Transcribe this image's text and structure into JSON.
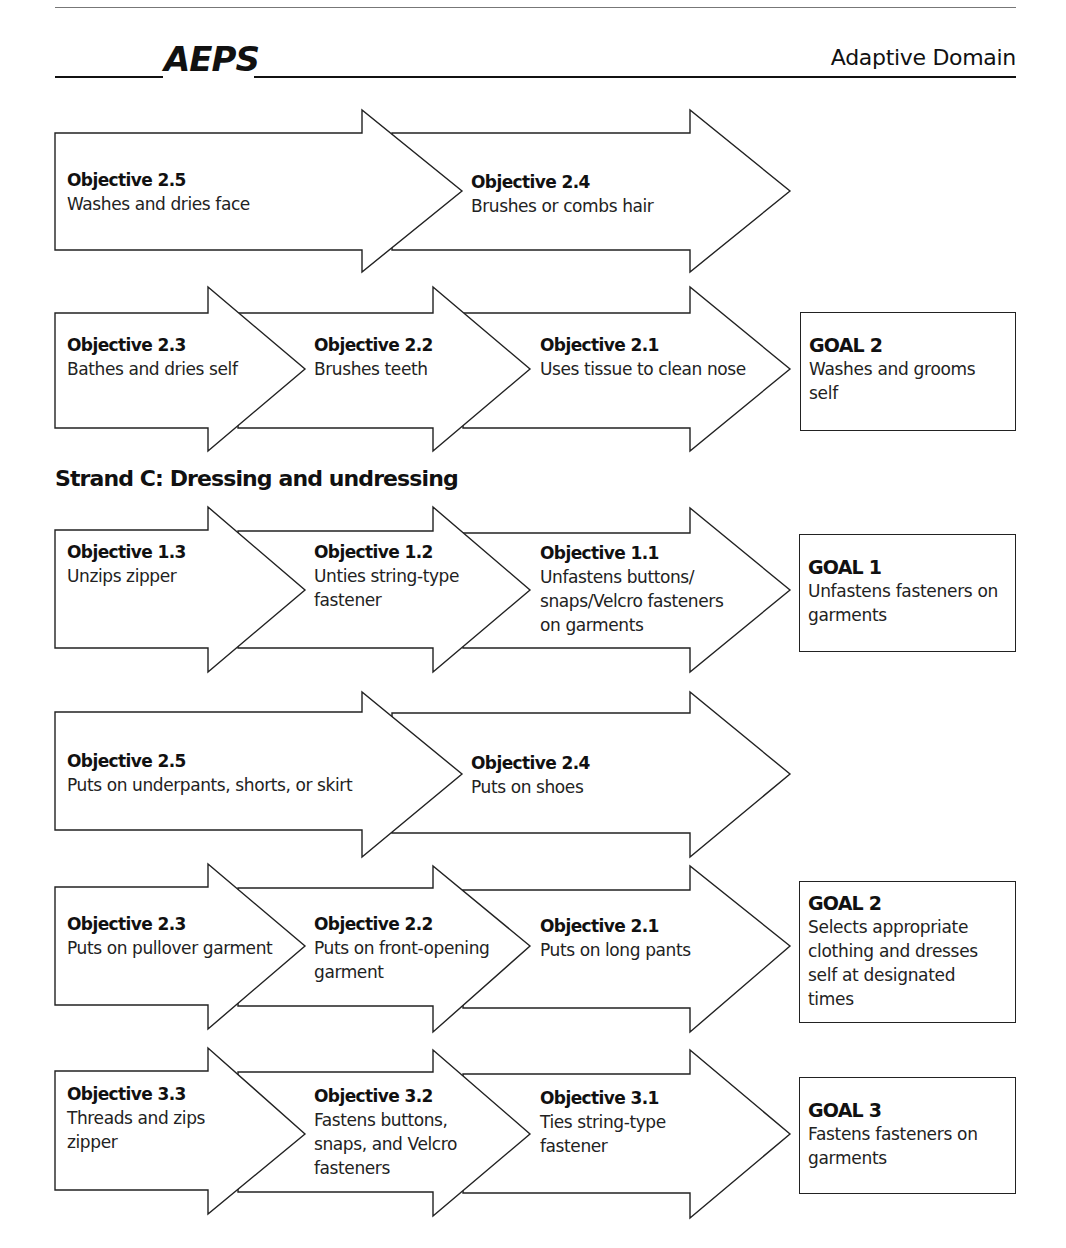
{
  "header": {
    "logo": "AEPS",
    "domain": "Adaptive Domain"
  },
  "rows": [
    {
      "objectives": [
        {
          "title": "Objective 2.5",
          "desc": "Washes and dries face"
        },
        {
          "title": "Objective 2.4",
          "desc": "Brushes or combs hair"
        }
      ]
    },
    {
      "objectives": [
        {
          "title": "Objective 2.3",
          "desc": "Bathes and dries self"
        },
        {
          "title": "Objective 2.2",
          "desc": "Brushes teeth"
        },
        {
          "title": "Objective 2.1",
          "desc": "Uses tissue to clean nose"
        }
      ],
      "goal": {
        "title": "GOAL 2",
        "desc": "Washes and grooms\nself"
      }
    }
  ],
  "strand": {
    "title": "Strand C: Dressing and undressing"
  },
  "strand_rows": [
    {
      "objectives": [
        {
          "title": "Objective 1.3",
          "desc": "Unzips zipper"
        },
        {
          "title": "Objective 1.2",
          "desc": "Unties string-type\nfastener"
        },
        {
          "title": "Objective 1.1",
          "desc": "Unfastens buttons/\nsnaps/Velcro fasteners\non garments"
        }
      ],
      "goal": {
        "title": "GOAL 1",
        "desc": "Unfastens fasteners on\ngarments"
      }
    },
    {
      "objectives": [
        {
          "title": "Objective 2.5",
          "desc": "Puts on underpants, shorts, or skirt"
        },
        {
          "title": "Objective 2.4",
          "desc": "Puts on shoes"
        }
      ]
    },
    {
      "objectives": [
        {
          "title": "Objective 2.3",
          "desc": "Puts on pullover garment"
        },
        {
          "title": "Objective 2.2",
          "desc": "Puts on front-opening\ngarment"
        },
        {
          "title": "Objective 2.1",
          "desc": "Puts on long pants"
        }
      ],
      "goal": {
        "title": "GOAL 2",
        "desc": "Selects appropriate\nclothing and dresses\nself at designated\ntimes"
      }
    },
    {
      "objectives": [
        {
          "title": "Objective 3.3",
          "desc": "Threads and zips\nzipper"
        },
        {
          "title": "Objective 3.2",
          "desc": "Fastens buttons,\nsnaps, and Velcro\nfasteners"
        },
        {
          "title": "Objective 3.1",
          "desc": "Ties string-type\nfastener"
        }
      ],
      "goal": {
        "title": "GOAL 3",
        "desc": "Fastens fasteners on\ngarments"
      }
    }
  ]
}
